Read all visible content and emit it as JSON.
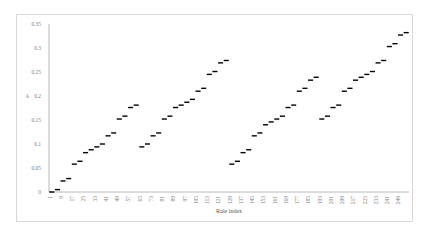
{
  "chart_data": {
    "type": "line",
    "title": "",
    "xlabel": "Rule index",
    "ylabel": "λ",
    "ylim": [
      0,
      0.35
    ],
    "xlim": [
      1,
      256
    ],
    "grid": false,
    "legend": null,
    "y_ticks": [
      "0",
      "0.05",
      "0.1",
      "0.15",
      "0.2",
      "0.25",
      "0.3",
      "0.35"
    ],
    "x_ticks": [
      "1",
      "9",
      "17",
      "25",
      "33",
      "41",
      "49",
      "57",
      "65",
      "73",
      "81",
      "89",
      "97",
      "105",
      "113",
      "121",
      "129",
      "137",
      "145",
      "153",
      "161",
      "169",
      "177",
      "185",
      "193",
      "201",
      "209",
      "217",
      "225",
      "233",
      "241",
      "249"
    ],
    "series": [
      {
        "name": "λ",
        "style": "short horizontal dashes (stepped plateaus)",
        "color": "#000000",
        "segments": [
          {
            "x": [
              1,
              4
            ],
            "y": 0.0
          },
          {
            "x": [
              5,
              8
            ],
            "y": 0.005
          },
          {
            "x": [
              9,
              12
            ],
            "y": 0.023
          },
          {
            "x": [
              13,
              16
            ],
            "y": 0.028
          },
          {
            "x": [
              17,
              20
            ],
            "y": 0.058
          },
          {
            "x": [
              21,
              24
            ],
            "y": 0.064
          },
          {
            "x": [
              25,
              28
            ],
            "y": 0.082
          },
          {
            "x": [
              29,
              32
            ],
            "y": 0.088
          },
          {
            "x": [
              33,
              36
            ],
            "y": 0.094
          },
          {
            "x": [
              37,
              40
            ],
            "y": 0.1
          },
          {
            "x": [
              41,
              44
            ],
            "y": 0.117
          },
          {
            "x": [
              45,
              48
            ],
            "y": 0.123
          },
          {
            "x": [
              49,
              52
            ],
            "y": 0.152
          },
          {
            "x": [
              53,
              56
            ],
            "y": 0.158
          },
          {
            "x": [
              57,
              60
            ],
            "y": 0.176
          },
          {
            "x": [
              61,
              64
            ],
            "y": 0.181
          },
          {
            "x": [
              65,
              68
            ],
            "y": 0.094
          },
          {
            "x": [
              69,
              72
            ],
            "y": 0.1
          },
          {
            "x": [
              73,
              76
            ],
            "y": 0.117
          },
          {
            "x": [
              77,
              80
            ],
            "y": 0.123
          },
          {
            "x": [
              81,
              84
            ],
            "y": 0.152
          },
          {
            "x": [
              85,
              88
            ],
            "y": 0.158
          },
          {
            "x": [
              89,
              92
            ],
            "y": 0.176
          },
          {
            "x": [
              93,
              96
            ],
            "y": 0.181
          },
          {
            "x": [
              97,
              100
            ],
            "y": 0.187
          },
          {
            "x": [
              101,
              104
            ],
            "y": 0.193
          },
          {
            "x": [
              105,
              108
            ],
            "y": 0.21
          },
          {
            "x": [
              109,
              112
            ],
            "y": 0.216
          },
          {
            "x": [
              113,
              116
            ],
            "y": 0.245
          },
          {
            "x": [
              117,
              120
            ],
            "y": 0.251
          },
          {
            "x": [
              121,
              124
            ],
            "y": 0.269
          },
          {
            "x": [
              125,
              128
            ],
            "y": 0.274
          },
          {
            "x": [
              129,
              132
            ],
            "y": 0.058
          },
          {
            "x": [
              133,
              136
            ],
            "y": 0.064
          },
          {
            "x": [
              137,
              140
            ],
            "y": 0.082
          },
          {
            "x": [
              141,
              144
            ],
            "y": 0.088
          },
          {
            "x": [
              145,
              148
            ],
            "y": 0.117
          },
          {
            "x": [
              149,
              152
            ],
            "y": 0.123
          },
          {
            "x": [
              153,
              156
            ],
            "y": 0.14
          },
          {
            "x": [
              157,
              160
            ],
            "y": 0.146
          },
          {
            "x": [
              161,
              164
            ],
            "y": 0.152
          },
          {
            "x": [
              165,
              168
            ],
            "y": 0.158
          },
          {
            "x": [
              169,
              172
            ],
            "y": 0.176
          },
          {
            "x": [
              173,
              176
            ],
            "y": 0.181
          },
          {
            "x": [
              177,
              180
            ],
            "y": 0.21
          },
          {
            "x": [
              181,
              184
            ],
            "y": 0.216
          },
          {
            "x": [
              185,
              188
            ],
            "y": 0.233
          },
          {
            "x": [
              189,
              192
            ],
            "y": 0.239
          },
          {
            "x": [
              193,
              196
            ],
            "y": 0.152
          },
          {
            "x": [
              197,
              200
            ],
            "y": 0.158
          },
          {
            "x": [
              201,
              204
            ],
            "y": 0.176
          },
          {
            "x": [
              205,
              208
            ],
            "y": 0.181
          },
          {
            "x": [
              209,
              212
            ],
            "y": 0.21
          },
          {
            "x": [
              213,
              216
            ],
            "y": 0.216
          },
          {
            "x": [
              217,
              220
            ],
            "y": 0.233
          },
          {
            "x": [
              221,
              224
            ],
            "y": 0.239
          },
          {
            "x": [
              225,
              228
            ],
            "y": 0.245
          },
          {
            "x": [
              229,
              232
            ],
            "y": 0.251
          },
          {
            "x": [
              233,
              236
            ],
            "y": 0.269
          },
          {
            "x": [
              237,
              240
            ],
            "y": 0.274
          },
          {
            "x": [
              241,
              244
            ],
            "y": 0.303
          },
          {
            "x": [
              245,
              248
            ],
            "y": 0.309
          },
          {
            "x": [
              249,
              252
            ],
            "y": 0.327
          },
          {
            "x": [
              253,
              256
            ],
            "y": 0.332
          }
        ]
      }
    ]
  },
  "colors": {
    "frame_border": "#d9d9d9",
    "axis": "#a6a6a6",
    "data": "#000000",
    "tick_text": "#7f7f7f"
  }
}
